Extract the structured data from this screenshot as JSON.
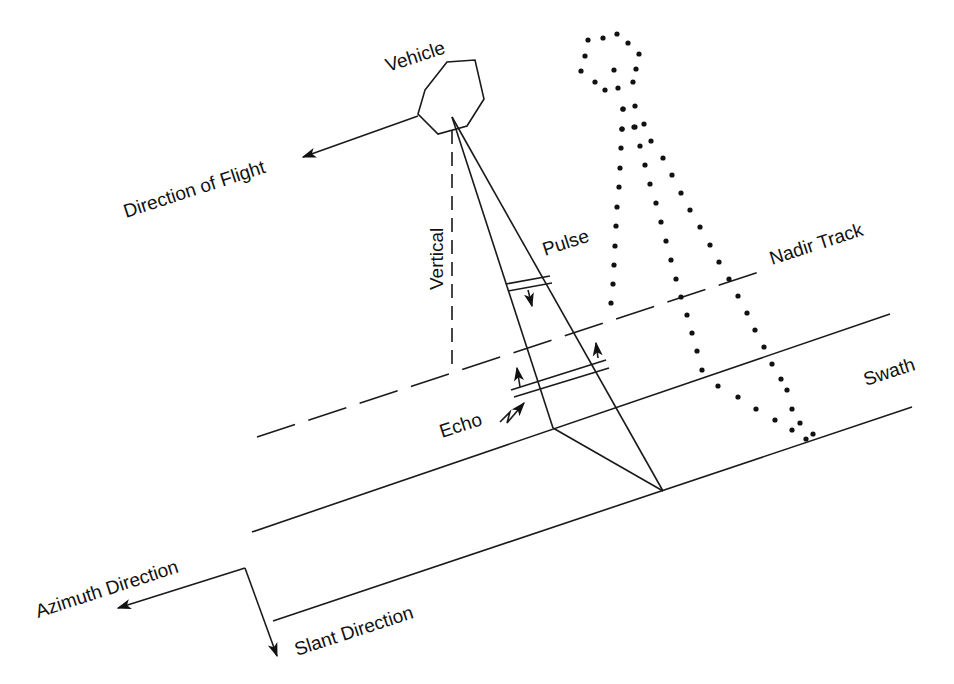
{
  "diagram": {
    "labels": {
      "vehicle": "Vehicle",
      "direction_of_flight": "Direction of Flight",
      "vertical": "Vertical",
      "pulse": "Pulse",
      "nadir_track": "Nadir Track",
      "swath": "Swath",
      "echo": "Echo",
      "azimuth_direction": "Azimuth Direction",
      "slant_direction": "Slant Direction"
    },
    "colors": {
      "line": "#1a1a1a",
      "text": "#111111",
      "background": "#ffffff"
    }
  }
}
